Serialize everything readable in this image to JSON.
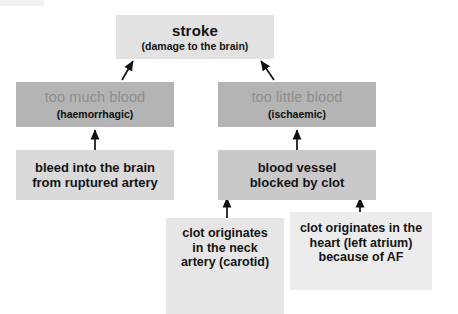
{
  "diagram": {
    "colors": {
      "top_box": "#e2e2e2",
      "category_box": "#b4b4b4",
      "category_main_text": "#8d8d8d",
      "mechanism_box_left": "#dadada",
      "mechanism_box_right": "#c9c9c9",
      "origin_box_left": "#e6e6e6",
      "origin_box_right": "#ececec",
      "text": "#141414",
      "arrow": "#111111",
      "background": "#ffffff"
    },
    "nodes": {
      "stroke": {
        "title": "stroke",
        "subtitle": "(damage to the brain)"
      },
      "haemorrhagic": {
        "main": "too much blood",
        "sub": "(haemorrhagic)"
      },
      "ischaemic": {
        "main": "too little blood",
        "sub": "(ischaemic)"
      },
      "bleed": {
        "line1": "bleed into the brain",
        "line2": "from ruptured artery"
      },
      "blocked": {
        "line1": "blood vessel",
        "line2": "blocked by clot"
      },
      "carotid": {
        "line1": "clot originates",
        "line2": "in the neck",
        "line3": "artery (carotid)"
      },
      "heart": {
        "line1": "clot originates in the",
        "line2": "heart (left atrium)",
        "line3": "because of AF"
      }
    },
    "arrows": [
      {
        "name": "haemorrhagic-to-stroke",
        "from": "too much blood",
        "to": "stroke",
        "style": "diagonal"
      },
      {
        "name": "ischaemic-to-stroke",
        "from": "too little blood",
        "to": "stroke",
        "style": "diagonal"
      },
      {
        "name": "bleed-to-haemorrhagic",
        "from": "bleed into the brain from ruptured artery",
        "to": "too much blood",
        "style": "vertical"
      },
      {
        "name": "blocked-to-ischaemic",
        "from": "blood vessel blocked by clot",
        "to": "too little blood",
        "style": "vertical"
      },
      {
        "name": "carotid-to-blocked",
        "from": "clot originates in the neck artery (carotid)",
        "to": "blood vessel blocked by clot",
        "style": "vertical"
      },
      {
        "name": "heart-to-blocked",
        "from": "clot originates in the heart (left atrium) because of AF",
        "to": "blood vessel blocked by clot",
        "style": "vertical"
      }
    ]
  }
}
